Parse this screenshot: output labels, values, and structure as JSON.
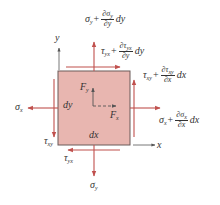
{
  "diagram": {
    "type": "stress element free body diagram",
    "colors": {
      "element_fill": "#e8b6b0",
      "element_border": "#6b5a58",
      "arrow": "#c0504d",
      "axis": "#555555",
      "text": "#333333"
    },
    "axes": {
      "x_label": "x",
      "y_label": "y"
    },
    "element": {
      "width_label": "dx",
      "height_label": "dy"
    },
    "body_forces": {
      "fx": "F",
      "fx_sub": "x",
      "fy": "F",
      "fy_sub": "y"
    },
    "top": {
      "normal": {
        "base": "σ",
        "base_sub": "y",
        "plus": "+",
        "num": "∂σ",
        "num_sub": "y",
        "den": "∂y",
        "tail": "dy"
      },
      "shear": {
        "base": "τ",
        "base_sub": "yx",
        "plus": "+",
        "num": "∂τ",
        "num_sub": "yx",
        "den": "∂y",
        "tail": "dy"
      }
    },
    "right": {
      "shear": {
        "base": "τ",
        "base_sub": "xy",
        "plus": "+",
        "num": "∂τ",
        "num_sub": "xy",
        "den": "∂x",
        "tail": "dx"
      },
      "normal": {
        "base": "σ",
        "base_sub": "x",
        "plus": "+",
        "num": "∂σ",
        "num_sub": "x",
        "den": "∂x",
        "tail": "dx"
      }
    },
    "left": {
      "normal": {
        "base": "σ",
        "base_sub": "x"
      },
      "shear": {
        "base": "τ",
        "base_sub": "xy"
      }
    },
    "bottom": {
      "normal": {
        "base": "σ",
        "base_sub": "y"
      },
      "shear": {
        "base": "τ",
        "base_sub": "yx"
      }
    }
  }
}
